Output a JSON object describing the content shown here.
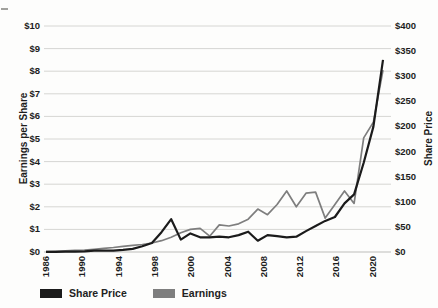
{
  "chart": {
    "left_axis_title": "Earnings per Share",
    "right_axis_title": "Share Price",
    "left_ticks": [
      "$10",
      "$9",
      "$8",
      "$7",
      "$6",
      "$5",
      "$4",
      "$3",
      "$2",
      "$1",
      "$0"
    ],
    "right_ticks": [
      "$400",
      "$350",
      "$300",
      "$250",
      "$200",
      "$200",
      "$150",
      "$100",
      "$50",
      "$0"
    ],
    "x_tick_labels": [
      "1986",
      "1990",
      "1994",
      "1998",
      "2000",
      "2004",
      "2008",
      "2012",
      "2016",
      "2020"
    ],
    "colors": {
      "share_price": "#1b1b1b",
      "earnings": "#7e7e7e",
      "gridline": "#d6d6d3",
      "baseline": "#bdbdba",
      "background": "#fdfdfc"
    }
  },
  "legend": {
    "items": [
      {
        "label": "Share Price",
        "color": "#1b1b1b"
      },
      {
        "label": "Earnings",
        "color": "#7e7e7e"
      }
    ]
  },
  "chart_data": {
    "type": "line",
    "x": [
      1986,
      1987,
      1988,
      1989,
      1990,
      1991,
      1992,
      1993,
      1994,
      1995,
      1996,
      1997,
      1998,
      1999,
      2000,
      2001,
      2002,
      2003,
      2004,
      2005,
      2006,
      2007,
      2008,
      2009,
      2010,
      2011,
      2012,
      2013,
      2014,
      2015,
      2016,
      2017,
      2018,
      2019,
      2020,
      2021
    ],
    "x_tick_labels": [
      "1986",
      "1990",
      "1994",
      "1998",
      "2000",
      "2004",
      "2008",
      "2012",
      "2016",
      "2020"
    ],
    "series": [
      {
        "name": "Share Price",
        "axis": "right",
        "color": "#1b1b1b",
        "values": [
          0.1,
          0.4,
          0.5,
          0.6,
          1.0,
          2.3,
          2.7,
          2.5,
          3.8,
          5.5,
          10,
          16,
          35,
          58,
          22,
          33,
          26,
          26,
          27,
          26,
          30,
          36,
          20,
          30,
          28,
          26,
          27,
          37,
          46,
          55,
          62,
          86,
          102,
          158,
          222,
          340
        ]
      },
      {
        "name": "Earnings",
        "axis": "left",
        "color": "#7e7e7e",
        "values": [
          0.02,
          0.03,
          0.05,
          0.07,
          0.09,
          0.12,
          0.16,
          0.2,
          0.25,
          0.29,
          0.33,
          0.4,
          0.5,
          0.65,
          0.85,
          1.0,
          1.05,
          0.7,
          1.2,
          1.15,
          1.25,
          1.45,
          1.9,
          1.65,
          2.1,
          2.7,
          2.0,
          2.6,
          2.65,
          1.5,
          2.1,
          2.7,
          2.15,
          5.05,
          5.75,
          8.05
        ]
      }
    ],
    "left_axis": {
      "label": "Earnings per Share",
      "range": [
        0,
        10
      ],
      "tick_step": 1
    },
    "right_axis": {
      "label": "Share Price",
      "range": [
        0,
        400
      ],
      "tick_labels_top_to_bottom": [
        "$400",
        "$350",
        "$300",
        "$250",
        "$200",
        "$200",
        "$150",
        "$100",
        "$50",
        "$0"
      ]
    },
    "grid": "horizontal",
    "legend_position": "bottom-left",
    "title": ""
  }
}
